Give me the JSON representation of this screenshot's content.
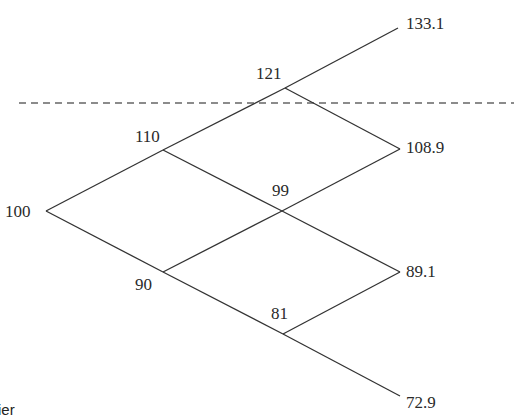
{
  "diagram": {
    "type": "binomial-tree",
    "steps": 3,
    "nodes": {
      "root": "100",
      "up1": "110",
      "down1": "90",
      "uu2": "121",
      "ud2": "99",
      "dd2": "81",
      "uuu3": "133.1",
      "uud3": "108.9",
      "udd3": "89.1",
      "ddd3": "72.9"
    },
    "barrier_line": "dashed horizontal line between 110 and 121 levels",
    "fragment_text": "ier",
    "colors": {
      "line": "#333333",
      "dash": "#666666",
      "text": "#2a2a2a",
      "background": "#ffffff"
    }
  }
}
